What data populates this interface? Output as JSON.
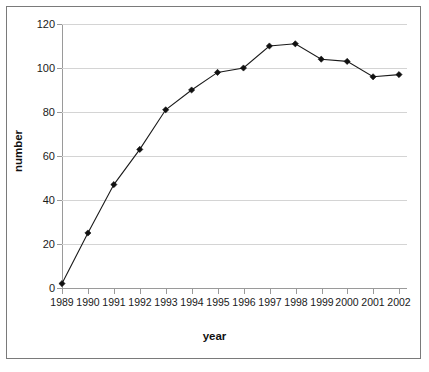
{
  "chart_data": {
    "type": "line",
    "title": "",
    "xlabel": "year",
    "ylabel": "number",
    "categories": [
      "1989",
      "1990",
      "1991",
      "1992",
      "1993",
      "1994",
      "1995",
      "1996",
      "1997",
      "1998",
      "1999",
      "2000",
      "2001",
      "2002"
    ],
    "x": [
      1989,
      1990,
      1991,
      1992,
      1993,
      1994,
      1995,
      1996,
      1997,
      1998,
      1999,
      2000,
      2001,
      2002
    ],
    "values": [
      2,
      25,
      47,
      63,
      81,
      90,
      98,
      100,
      110,
      111,
      104,
      103,
      96,
      97
    ],
    "series": [
      {
        "name": "number",
        "values": [
          2,
          25,
          47,
          63,
          81,
          90,
          98,
          100,
          110,
          111,
          104,
          103,
          96,
          97
        ]
      }
    ],
    "ylim": [
      0,
      120
    ],
    "yticks": [
      0,
      20,
      40,
      60,
      80,
      100,
      120
    ],
    "ytick_labels": [
      "0",
      "20",
      "40",
      "60",
      "80",
      "100",
      "120"
    ],
    "grid": true,
    "grid_axis": "y",
    "legend": false,
    "legend_position": "none",
    "marker": "diamond",
    "line_color": "#1a1a1a",
    "marker_color": "#111111",
    "grid_color": "#d4d4d4",
    "axis_color": "#9a9a9a",
    "background": "#ffffff"
  }
}
